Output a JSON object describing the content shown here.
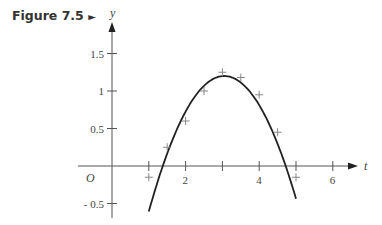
{
  "figure": {
    "label": "Figure 7.5",
    "marker": "►"
  },
  "chart_data": {
    "type": "scatter",
    "title": "",
    "xlabel": "t",
    "ylabel": "y",
    "origin_label": "O",
    "xlim": [
      0,
      6.5
    ],
    "ylim": [
      -0.6,
      1.8
    ],
    "x_ticks": [
      1,
      2,
      3,
      4,
      5,
      6
    ],
    "x_tick_labels": [
      "",
      "2",
      "",
      "4",
      "",
      "6"
    ],
    "y_ticks": [
      -0.5,
      0.5,
      1,
      1.5
    ],
    "y_tick_labels": [
      "- 0.5",
      "0.5",
      "1",
      "1.5"
    ],
    "grid": false,
    "series": [
      {
        "name": "data points",
        "marker": "+",
        "x": [
          1,
          1.5,
          2,
          2.5,
          3,
          3.5,
          4,
          4.5,
          5
        ],
        "y": [
          -0.15,
          0.25,
          0.6,
          1.0,
          1.25,
          1.18,
          0.95,
          0.45,
          -0.15
        ]
      },
      {
        "name": "fitted curve",
        "style": "line",
        "type": "parabola",
        "vertex": [
          3.05,
          1.2
        ],
        "x_range": [
          1.0,
          5.0
        ]
      }
    ]
  }
}
